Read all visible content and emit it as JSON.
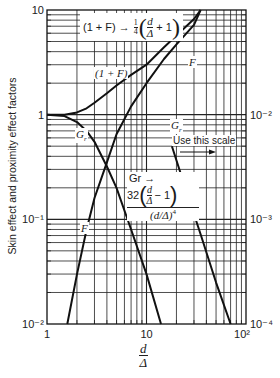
{
  "chart_data": {
    "type": "line",
    "scale": "log-log",
    "title": "",
    "xlabel": "d/Δ",
    "ylabel": "Skin effect and proximity effect factors",
    "xlim": [
      1,
      100
    ],
    "ylim_left": [
      0.01,
      10
    ],
    "ylim_right": [
      0.0001,
      0.1
    ],
    "x_tick_labels": [
      "1",
      "10",
      "10²"
    ],
    "y_left_tick_labels": [
      "10⁻²",
      "10⁻¹",
      "1",
      "10"
    ],
    "y_right_tick_labels": [
      "10⁻⁴",
      "10⁻³",
      "10⁻²"
    ],
    "grid": true,
    "series": [
      {
        "name": "(1 + F)",
        "axis": "left",
        "x": [
          1,
          1.5,
          2,
          2.5,
          3,
          4,
          5,
          7,
          10,
          15,
          20,
          30,
          35
        ],
        "y": [
          1,
          1.0,
          1.05,
          1.15,
          1.3,
          1.6,
          1.9,
          2.4,
          3.0,
          4.4,
          5.7,
          8.2,
          10
        ]
      },
      {
        "name": "F",
        "axis": "left",
        "x": [
          1.6,
          2,
          2.5,
          3,
          4,
          5,
          7,
          10,
          15,
          20,
          30,
          35
        ],
        "y": [
          0.01,
          0.03,
          0.08,
          0.16,
          0.35,
          0.65,
          1.2,
          2.0,
          3.4,
          4.7,
          7.2,
          10
        ]
      },
      {
        "name": "Gr",
        "axis": "left",
        "x": [
          1,
          1.5,
          2,
          2.5,
          3,
          4,
          5,
          7,
          10,
          14
        ],
        "y": [
          1,
          0.97,
          0.85,
          0.7,
          0.55,
          0.32,
          0.2,
          0.08,
          0.03,
          0.01
        ]
      },
      {
        "name": "Gr (asymptote, right scale)",
        "axis": "right",
        "x": [
          18,
          25,
          35,
          50,
          70
        ],
        "y": [
          0.005,
          0.0019,
          0.00072,
          0.00025,
          0.0001
        ]
      }
    ],
    "annotations": [
      {
        "text": "(1 + F) → ¼(d/Δ + 1)"
      },
      {
        "text": "(1 + F)"
      },
      {
        "text": "F"
      },
      {
        "text": "F"
      },
      {
        "text": "Gr"
      },
      {
        "text": "Gr"
      },
      {
        "text": "Use this scale →"
      },
      {
        "text": "Gr → 32(d/Δ − 1)/(d/Δ)⁴"
      }
    ]
  },
  "labels": {
    "y_axis": "Skin effect and proximity effect factors",
    "x_num": "d",
    "x_den": "Δ",
    "ann_top_prefix": "(1 + F) → ",
    "ann_top_quarter": "1",
    "ann_top_quarter_den": "4",
    "ann_top_plus": "+ 1",
    "ann_1F": "(1 + F)",
    "ann_F_top": "F",
    "ann_F_bottom": "F",
    "ann_Gr_left": "G",
    "ann_Gr_right": "G",
    "ann_r": "r",
    "use_scale": "Use this scale",
    "gr_arrow": "Gr →",
    "gr_32": "32",
    "gr_minus": "− 1",
    "gr_den": "(d/Δ)",
    "gr_pow": "4"
  }
}
